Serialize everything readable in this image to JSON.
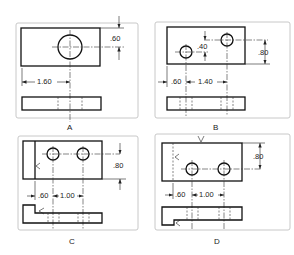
{
  "figure": {
    "panels": [
      {
        "id": "A",
        "label": "A",
        "dims": {
          "vertical": ".60",
          "horizontal": "1.60"
        }
      },
      {
        "id": "B",
        "label": "B",
        "dims": {
          "hole_offset": ".40",
          "vertical": ".80",
          "left": ".60",
          "spacing": "1.40"
        }
      },
      {
        "id": "C",
        "label": "C",
        "dims": {
          "vertical": ".80",
          "left": ".60",
          "spacing": "1.00"
        }
      },
      {
        "id": "D",
        "label": "D",
        "dims": {
          "vertical": ".80",
          "left": ".60",
          "spacing": "1.00"
        }
      }
    ]
  }
}
